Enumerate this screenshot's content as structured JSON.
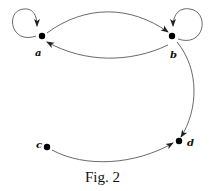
{
  "figure": {
    "caption": "Fig. 2",
    "nodes": [
      {
        "id": "a",
        "label": "a",
        "x": 42,
        "y": 36
      },
      {
        "id": "b",
        "label": "b",
        "x": 172,
        "y": 36
      },
      {
        "id": "c",
        "label": "c",
        "x": 47,
        "y": 147
      },
      {
        "id": "d",
        "label": "d",
        "x": 179,
        "y": 141
      }
    ],
    "edges": [
      {
        "from": "a",
        "to": "a",
        "type": "self-loop"
      },
      {
        "from": "b",
        "to": "b",
        "type": "self-loop"
      },
      {
        "from": "a",
        "to": "b",
        "type": "curve"
      },
      {
        "from": "b",
        "to": "a",
        "type": "curve"
      },
      {
        "from": "b",
        "to": "d",
        "type": "curve"
      },
      {
        "from": "c",
        "to": "d",
        "type": "curve"
      }
    ],
    "colors": {
      "stroke": "#333333",
      "node": "#000000"
    }
  }
}
